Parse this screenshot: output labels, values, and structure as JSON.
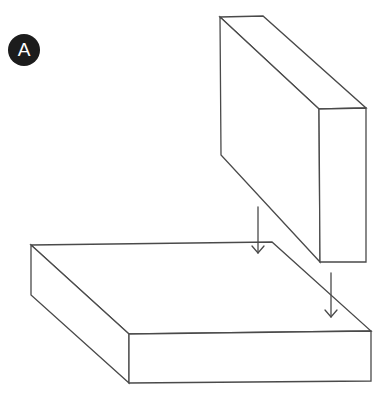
{
  "figure": {
    "label": "A",
    "stroke_color": "#4a4a4a",
    "badge_color": "#1c1c1c"
  },
  "blocks": {
    "upright_block": {
      "description": "tall thin block positioned above, being lowered",
      "vertices": {
        "back_top_left": [
          220,
          17
        ],
        "back_top_right": [
          263,
          16
        ],
        "front_top_left": [
          319,
          109
        ],
        "front_top_right": [
          366,
          108
        ],
        "back_bottom_left": [
          221,
          155
        ],
        "front_bottom_left": [
          320,
          262
        ],
        "front_bottom_right": [
          366,
          262
        ]
      }
    },
    "base_slab": {
      "description": "wide flat slab below",
      "vertices": {
        "back_top_left": [
          31,
          245
        ],
        "back_top_right": [
          272,
          242
        ],
        "front_top_left": [
          129,
          334
        ],
        "front_top_right": [
          371,
          331
        ],
        "back_bottom_left": [
          31,
          295
        ],
        "front_bottom_left": [
          129,
          383
        ],
        "front_bottom_right": [
          371,
          381
        ]
      }
    }
  },
  "arrows": [
    {
      "name": "arrow-left",
      "x": 258,
      "y_start": 207,
      "y_end": 253,
      "direction": "down"
    },
    {
      "name": "arrow-right",
      "x": 331,
      "y_start": 273,
      "y_end": 317,
      "direction": "down"
    }
  ]
}
